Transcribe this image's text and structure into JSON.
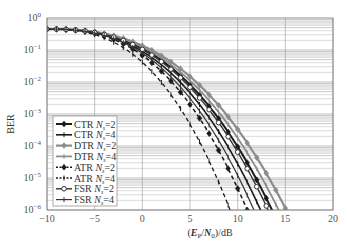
{
  "chart_data": {
    "type": "line",
    "title": "",
    "xlabel": "(E_P/N_0)/dB",
    "ylabel": "BER",
    "xlim": [
      -10,
      20
    ],
    "ylim": [
      1e-06,
      1
    ],
    "yscale": "log",
    "grid": true,
    "legend_position": "lower left",
    "x_ticks": [
      -10,
      -5,
      0,
      5,
      10,
      15,
      20
    ],
    "x_tick_labels": [
      "−10",
      "−5",
      "0",
      "5",
      "10",
      "15",
      "20"
    ],
    "y_ticks": [
      0,
      -1,
      -2,
      -3,
      -4,
      -5,
      -6
    ],
    "y_tick_labels": [
      "10^0",
      "10^-1",
      "10^-2",
      "10^-3",
      "10^-4",
      "10^-5",
      "10^-6"
    ],
    "series": [
      {
        "name": "CTR N_s=2",
        "label_main": "CTR ",
        "label_sub": "s",
        "label_val": "=2",
        "color": "#1a1a1a",
        "width": 2.0,
        "dash": "",
        "marker": "diamond-filled",
        "cross_db": 13.6,
        "knee_db": 3.0
      },
      {
        "name": "CTR N_s=4",
        "label_main": "CTR ",
        "label_sub": "s",
        "label_val": "=4",
        "color": "#1a1a1a",
        "width": 1.6,
        "dash": "",
        "marker": "tick",
        "cross_db": 12.4,
        "knee_db": 2.5
      },
      {
        "name": "DTR N_s=2",
        "label_main": "DTR ",
        "label_sub": "s",
        "label_val": "=2",
        "color": "#8c8c8c",
        "width": 2.2,
        "dash": "",
        "marker": "diamond-filled",
        "cross_db": 15.1,
        "knee_db": 3.8
      },
      {
        "name": "DTR N_s=4",
        "label_main": "DTR ",
        "label_sub": "s",
        "label_val": "=4",
        "color": "#8c8c8c",
        "width": 1.8,
        "dash": "",
        "marker": "tick",
        "cross_db": 14.3,
        "knee_db": 3.4
      },
      {
        "name": "ATR N_s=2",
        "label_main": "ATR ",
        "label_sub": "s",
        "label_val": "=2",
        "color": "#1a1a1a",
        "width": 1.5,
        "dash": "4,3",
        "marker": "diamond-filled",
        "cross_db": 11.0,
        "knee_db": 1.5
      },
      {
        "name": "ATR N_s=4",
        "label_main": "ATR ",
        "label_sub": "s",
        "label_val": "=4",
        "color": "#1a1a1a",
        "width": 1.3,
        "dash": "4,3",
        "marker": "tick",
        "cross_db": 9.2,
        "knee_db": 0.6
      },
      {
        "name": "FSR N_s=2",
        "label_main": "FSR ",
        "label_sub": "s",
        "label_val": "=2",
        "color": "#333333",
        "width": 1.4,
        "dash": "",
        "marker": "circle-open",
        "cross_db": 13.2,
        "knee_db": 3.2
      },
      {
        "name": "FSR N_s=4",
        "label_main": "FSR ",
        "label_sub": "s",
        "label_val": "=4",
        "color": "#333333",
        "width": 1.2,
        "dash": "",
        "marker": "tick",
        "cross_db": 11.7,
        "knee_db": 2.2
      }
    ],
    "start_ber": 0.45
  }
}
